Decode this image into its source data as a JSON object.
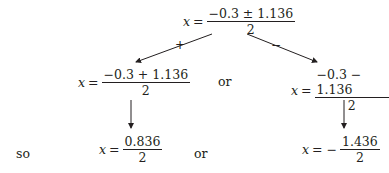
{
  "top": {
    "var": "x",
    "eq": "=",
    "num": "−0.3 ± 1.136",
    "den": "2"
  },
  "branch_labels": {
    "plus": "+",
    "minus": "−"
  },
  "left_mid": {
    "var": "x",
    "eq": "=",
    "num": "−0.3 + 1.136",
    "den": "2"
  },
  "right_mid": {
    "var": "x",
    "eq": "=",
    "num": "−0.3 − 1.136",
    "den": "2"
  },
  "mid_or": "or",
  "so": "so",
  "left_bottom": {
    "var": "x",
    "eq": "=",
    "num": "0.836",
    "den": "2"
  },
  "bottom_or": "or",
  "right_bottom": {
    "var": "x",
    "eq": "= −",
    "num": "1.436",
    "den": "2"
  }
}
